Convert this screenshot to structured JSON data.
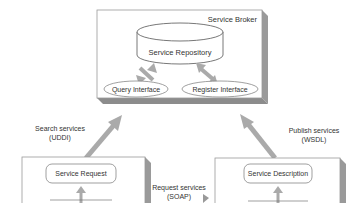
{
  "broker": {
    "title": "Service Broker",
    "repository": "Service Repository",
    "query_interface": "Query Interface",
    "register_interface": "Register Interface"
  },
  "requester": {
    "box_label": "Service Request"
  },
  "provider": {
    "box_label": "Service Description"
  },
  "arrows": {
    "search_line1": "Search services",
    "search_line2": "(UDDI)",
    "publish_line1": "Publish services",
    "publish_line2": "(WSDL)",
    "request_line1": "Request services",
    "request_line2": "(SOAP)"
  }
}
